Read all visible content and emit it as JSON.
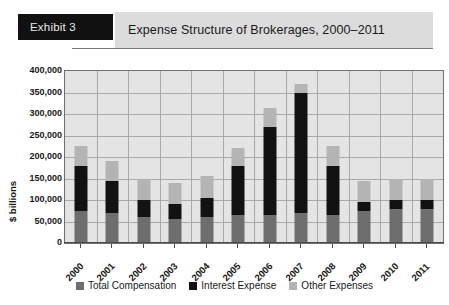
{
  "header": {
    "exhibit_label": "Exhibit 3",
    "title": "Expense Structure of Brokerages, 2000–2011"
  },
  "chart_data": {
    "type": "bar",
    "subtype": "stacked-vertical",
    "title": "Expense Structure of Brokerages, 2000–2011",
    "xlabel": "",
    "ylabel": "$ billions",
    "ylim": [
      0,
      400000
    ],
    "ytick_step": 50000,
    "yticks": [
      0,
      50000,
      100000,
      150000,
      200000,
      250000,
      300000,
      350000,
      400000
    ],
    "ytick_labels": [
      "0",
      "50,000",
      "100,000",
      "150,000",
      "200,000",
      "250,000",
      "300,000",
      "350,000",
      "400,000"
    ],
    "grid": true,
    "legend_position": "bottom",
    "categories": [
      "2000",
      "2001",
      "2002",
      "2003",
      "2004",
      "2005",
      "2006",
      "2007",
      "2008",
      "2009",
      "2010",
      "2011"
    ],
    "series": [
      {
        "name": "Total Compensation",
        "color": "#6e6e6e",
        "values": [
          75000,
          70000,
          60000,
          55000,
          60000,
          65000,
          65000,
          70000,
          65000,
          75000,
          80000,
          80000
        ]
      },
      {
        "name": "Interest Expense",
        "color": "#121212",
        "values": [
          105000,
          75000,
          40000,
          35000,
          45000,
          115000,
          205000,
          280000,
          115000,
          20000,
          20000,
          20000
        ]
      },
      {
        "name": "Other Expenses",
        "color": "#b4b4b4",
        "values": [
          45000,
          45000,
          50000,
          50000,
          50000,
          40000,
          45000,
          20000,
          45000,
          50000,
          50000,
          50000
        ]
      }
    ],
    "totals": [
      225000,
      190000,
      150000,
      140000,
      155000,
      220000,
      315000,
      370000,
      225000,
      145000,
      150000,
      150000
    ]
  },
  "colors": {
    "plot_background": "#e4e4e4",
    "gridline": "#a9a9a9",
    "axis": "#4a4a4a",
    "header_tab_background": "#111111",
    "header_tab_text": "#e9e9e9",
    "title_band_background": "#dcdcdc"
  }
}
